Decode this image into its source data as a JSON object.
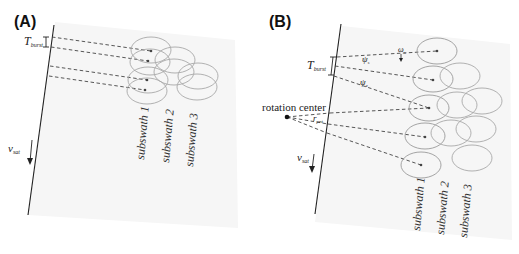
{
  "figure": {
    "panels": [
      {
        "id": "A",
        "label": "(A)",
        "burst_label": "T",
        "burst_sub": "burst",
        "velocity_label": "v",
        "velocity_sub": "sat",
        "subswaths": [
          "subswath 1",
          "subswath 2",
          "subswath 3"
        ]
      },
      {
        "id": "B",
        "label": "(B)",
        "burst_label": "T",
        "burst_sub": "burst",
        "velocity_label": "v",
        "velocity_sub": "sat",
        "rotation_center_label": "rotation center",
        "omega_label": "ω",
        "omega_sub": "s",
        "psi_label_1": "ψ",
        "psi_sub_1": "s",
        "psi_label_2": "ψ",
        "psi_sub_2": "e",
        "r_label": "r",
        "r_sub": "pnt",
        "subswaths": [
          "subswath 1",
          "subswath 2",
          "subswath 3"
        ]
      }
    ],
    "colors": {
      "line": "#222222",
      "ellipse": "#a8a8a8",
      "background": "#ffffff",
      "paper": "#f6f6f6"
    }
  }
}
